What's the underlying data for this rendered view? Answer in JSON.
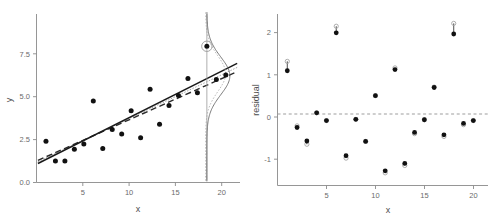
{
  "figure": {
    "title": "",
    "panels": [
      "scatter-with-density",
      "residual-plot"
    ]
  },
  "chart_data": [
    {
      "type": "scatter",
      "panel": "left",
      "title": "",
      "xlabel": "x",
      "ylabel": "y",
      "xlim": [
        0,
        21.5
      ],
      "ylim": [
        -0.4,
        9.0
      ],
      "xticks": [
        5,
        10,
        15,
        20
      ],
      "yticks": [
        0.0,
        2.5,
        5.0,
        7.5
      ],
      "xticklabels": [
        "5",
        "10",
        "15",
        "20"
      ],
      "yticklabels": [
        "0.0",
        "2.5",
        "5.0",
        "7.5"
      ],
      "grid": false,
      "legend": "none",
      "x": [
        1,
        2,
        3,
        4,
        5,
        6,
        7,
        8,
        9,
        10,
        11,
        12,
        13,
        14,
        15,
        16,
        17,
        18,
        19,
        20
      ],
      "y": [
        1.9,
        0.8,
        0.8,
        1.45,
        1.75,
        4.15,
        1.5,
        2.55,
        2.3,
        3.6,
        2.1,
        4.8,
        2.85,
        3.9,
        4.45,
        5.4,
        4.6,
        7.2,
        5.35,
        5.6
      ],
      "series": [
        {
          "name": "observed points",
          "marker": "filled-circle",
          "color": "#111111",
          "values": [
            1.9,
            0.8,
            0.8,
            1.45,
            1.75,
            4.15,
            1.5,
            2.55,
            2.3,
            3.6,
            2.1,
            4.8,
            2.85,
            3.9,
            4.45,
            5.4,
            4.6,
            7.2,
            5.35,
            5.6
          ]
        }
      ],
      "fit_lines": [
        {
          "name": "full-data fit",
          "style": "solid",
          "color": "#1a1a1a",
          "intercept": 0.62,
          "slope": 0.2655
        },
        {
          "name": "reduced fit",
          "style": "dashed",
          "color": "#2b2b2b",
          "intercept": 0.8,
          "slope": 0.235
        },
        {
          "name": "auxiliary fit",
          "style": "dotted",
          "color": "#9a9a9a",
          "intercept": 0.72,
          "slope": 0.25
        }
      ],
      "density_overlay": {
        "name": "conditional density at x",
        "at_x": 18,
        "center_y": 5.55,
        "curves": [
          {
            "style": "solid",
            "color": "#5a5a5a"
          },
          {
            "style": "dotted",
            "color": "#a8a8a8"
          }
        ]
      },
      "highlighted_point": {
        "x": 18,
        "y": 7.2,
        "marker": "circled",
        "note": "influential observation"
      }
    },
    {
      "type": "scatter",
      "panel": "right",
      "title": "",
      "xlabel": "x",
      "ylabel": "residual",
      "xlim": [
        0,
        21.5
      ],
      "ylim": [
        -1.75,
        2.45
      ],
      "xticks": [
        5,
        10,
        15,
        20
      ],
      "yticks": [
        -1,
        0,
        1,
        2
      ],
      "xticklabels": [
        "5",
        "10",
        "15",
        "20"
      ],
      "yticklabels": [
        "-1",
        "0",
        "1",
        "2"
      ],
      "grid": false,
      "legend": "none",
      "reference_line": {
        "y": 0,
        "style": "dashed",
        "color": "#9e9e9e"
      },
      "x": [
        1,
        2,
        3,
        4,
        5,
        6,
        7,
        8,
        9,
        10,
        11,
        12,
        13,
        14,
        15,
        16,
        17,
        18,
        19,
        20
      ],
      "series": [
        {
          "name": "residual (filled)",
          "marker": "filled-circle",
          "color": "#111111",
          "values": [
            1.06,
            -0.33,
            -0.66,
            0.03,
            -0.16,
            1.99,
            -1.02,
            -0.13,
            -0.67,
            0.45,
            -1.39,
            1.09,
            -1.21,
            -0.45,
            -0.14,
            0.65,
            -0.51,
            1.96,
            -0.23,
            -0.16
          ]
        },
        {
          "name": "residual (open, alternative fit)",
          "marker": "open-circle",
          "color": "#a5a5a5",
          "values": [
            1.29,
            -0.29,
            -0.74,
            0.03,
            -0.16,
            2.15,
            -1.08,
            -0.13,
            -0.67,
            0.45,
            -1.44,
            1.13,
            -1.26,
            -0.48,
            -0.14,
            0.66,
            -0.55,
            2.22,
            -0.26,
            -0.16
          ]
        }
      ]
    }
  ]
}
